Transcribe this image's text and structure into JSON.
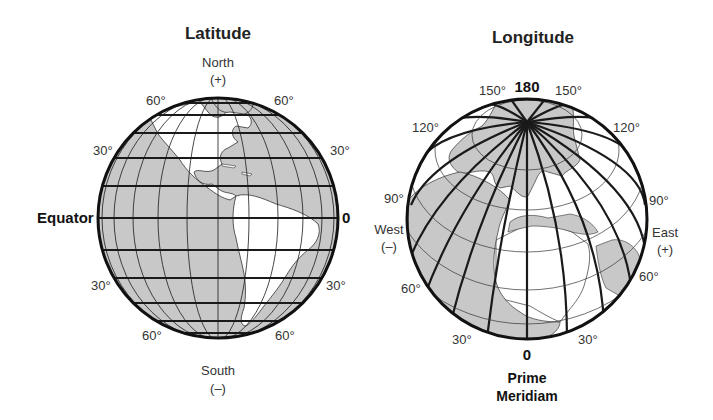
{
  "latitude": {
    "title": "Latitude",
    "north_label": "North",
    "north_sign": "(+)",
    "south_label": "South",
    "south_sign": "(–)",
    "equator_label": "Equator",
    "equator_value": "0",
    "labels": {
      "n60_left": "60°",
      "n60_right": "60°",
      "n30_left": "30°",
      "n30_right": "30°",
      "s30_left": "30°",
      "s30_right": "30°",
      "s60_left": "60°",
      "s60_right": "60°"
    },
    "parallels_deg": [
      -75,
      -60,
      -45,
      -30,
      -15,
      0,
      15,
      30,
      45,
      60,
      75
    ],
    "colors": {
      "ocean": "#c8c8c8",
      "land": "#ffffff",
      "line": "#1a1a1a"
    }
  },
  "longitude": {
    "title": "Longitude",
    "top_value": "180",
    "prime_value": "0",
    "prime_label_1": "Prime",
    "prime_label_2": "Meridiam",
    "west_label": "West",
    "west_sign": "(–)",
    "east_label": "East",
    "east_sign": "(+)",
    "labels": {
      "w150": "150°",
      "e150": "150°",
      "w120": "120°",
      "e120": "120°",
      "w90": "90°",
      "e90": "90°",
      "w60": "60°",
      "e60": "60°",
      "w30": "30°",
      "e30": "30°"
    },
    "meridian_step_deg": 15,
    "colors": {
      "ocean": "#ffffff",
      "land": "#c8c8c8",
      "line": "#1a1a1a"
    }
  }
}
